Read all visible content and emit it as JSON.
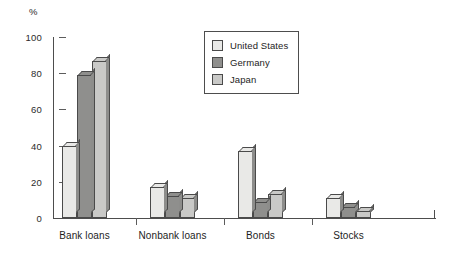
{
  "chart_data": {
    "type": "bar",
    "title": "",
    "subtitle": "",
    "xlabel": "",
    "ylabel": "%",
    "ylim": [
      0,
      100
    ],
    "yticks": [
      0,
      20,
      40,
      60,
      80,
      100
    ],
    "grid": false,
    "legend_position": "top-center-right",
    "categories": [
      "Bank loans",
      "Nonbank loans",
      "Bonds",
      "Stocks"
    ],
    "series": [
      {
        "name": "United States",
        "color": "#e9e9e7",
        "values": [
          40,
          17,
          37,
          11
        ]
      },
      {
        "name": "Germany",
        "color": "#8f8f8d",
        "values": [
          79,
          12,
          9,
          6
        ]
      },
      {
        "name": "Japan",
        "color": "#c9c9c7",
        "values": [
          87,
          11,
          13,
          4
        ]
      }
    ],
    "annotations": []
  },
  "axes": {
    "unit_label": "%",
    "tick_labels": [
      "0",
      "20",
      "40",
      "60",
      "80",
      "100"
    ]
  },
  "legend": {
    "entries": [
      {
        "label": "United States"
      },
      {
        "label": "Germany"
      },
      {
        "label": "Japan"
      }
    ]
  }
}
